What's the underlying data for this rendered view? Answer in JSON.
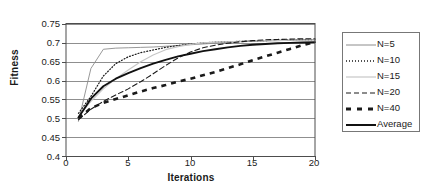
{
  "chart_data": {
    "type": "line",
    "title": "",
    "xlabel": "Iterations",
    "ylabel": "Fitness",
    "xlim": [
      0,
      20
    ],
    "ylim": [
      0.4,
      0.75
    ],
    "xticks": [
      "0",
      "5",
      "10",
      "15",
      "20"
    ],
    "xtick_values": [
      0,
      5,
      10,
      15,
      20
    ],
    "yticks": [
      "0.4",
      "0.45",
      "0.5",
      "0.55",
      "0.6",
      "0.65",
      "0.7",
      "0.75"
    ],
    "ytick_values": [
      0.4,
      0.45,
      0.5,
      0.55,
      0.6,
      0.65,
      0.7,
      0.75
    ],
    "grid": "horizontal",
    "legend_position": "right",
    "x": [
      1,
      2,
      3,
      4,
      5,
      6,
      7,
      8,
      9,
      10,
      11,
      12,
      13,
      14,
      15,
      16,
      17,
      18,
      19,
      20
    ],
    "series": [
      {
        "name": "N = 5",
        "label": "N=5",
        "style": "thin-solid-gray",
        "color": "#8c8c8c",
        "width": 0.9,
        "dash": "none",
        "values": [
          0.492,
          0.632,
          0.683,
          0.686,
          0.687,
          0.688,
          0.689,
          0.691,
          0.693,
          0.695,
          0.697,
          0.699,
          0.701,
          0.703,
          0.704,
          0.705,
          0.706,
          0.707,
          0.708,
          0.709
        ]
      },
      {
        "name": "N = 10",
        "label": "N=10",
        "style": "dotted-black",
        "color": "#1a1a1a",
        "width": 1.2,
        "dash": "1,2",
        "values": [
          0.513,
          0.558,
          0.612,
          0.645,
          0.663,
          0.674,
          0.681,
          0.688,
          0.693,
          0.697,
          0.7,
          0.702,
          0.703,
          0.704,
          0.705,
          0.706,
          0.707,
          0.707,
          0.708,
          0.708
        ]
      },
      {
        "name": "N = 15",
        "label": "N=15",
        "style": "thin-solid-lightgray",
        "color": "#c6c6c6",
        "width": 1.1,
        "dash": "none",
        "values": [
          0.505,
          0.545,
          0.578,
          0.605,
          0.628,
          0.65,
          0.668,
          0.682,
          0.69,
          0.696,
          0.7,
          0.702,
          0.703,
          0.704,
          0.705,
          0.706,
          0.706,
          0.707,
          0.707,
          0.708
        ]
      },
      {
        "name": "N = 20",
        "label": "N=20",
        "style": "dashed-black",
        "color": "#1a1a1a",
        "width": 1.1,
        "dash": "5,3",
        "values": [
          0.496,
          0.524,
          0.545,
          0.562,
          0.578,
          0.597,
          0.618,
          0.64,
          0.66,
          0.676,
          0.687,
          0.694,
          0.699,
          0.703,
          0.706,
          0.708,
          0.709,
          0.71,
          0.711,
          0.711
        ]
      },
      {
        "name": "N = 40",
        "label": "N=40",
        "style": "thick-dashed-black",
        "color": "#1a1a1a",
        "width": 2.6,
        "dash": "5,5",
        "values": [
          0.5,
          0.527,
          0.541,
          0.551,
          0.561,
          0.571,
          0.58,
          0.588,
          0.597,
          0.605,
          0.614,
          0.623,
          0.633,
          0.643,
          0.654,
          0.664,
          0.674,
          0.684,
          0.694,
          0.702
        ]
      },
      {
        "name": "Average",
        "label": "Average",
        "style": "thick-solid-black",
        "color": "#111111",
        "width": 1.9,
        "dash": "none",
        "values": [
          0.502,
          0.552,
          0.585,
          0.605,
          0.62,
          0.633,
          0.645,
          0.655,
          0.664,
          0.671,
          0.678,
          0.683,
          0.688,
          0.692,
          0.695,
          0.697,
          0.699,
          0.7,
          0.701,
          0.702
        ]
      }
    ]
  },
  "axes": {
    "ylabel": "Fitness",
    "xlabel": "Iterations",
    "yticks": [
      "0.75",
      "0.7",
      "0.65",
      "0.6",
      "0.55",
      "0.5",
      "0.45",
      "0.4"
    ],
    "xticks": [
      "0",
      "5",
      "10",
      "15",
      "20"
    ]
  },
  "legend": {
    "items": [
      {
        "label": "N=5"
      },
      {
        "label": "N=10"
      },
      {
        "label": "N=15"
      },
      {
        "label": "N=20"
      },
      {
        "label": "N=40"
      },
      {
        "label": "Average"
      }
    ]
  },
  "colors": {
    "axis": "#4d4d4d",
    "grid": "#8f8f8f",
    "text": "#1a1a1a",
    "gray_line": "#8c8c8c",
    "light_gray_line": "#c6c6c6",
    "black_line": "#111111"
  }
}
